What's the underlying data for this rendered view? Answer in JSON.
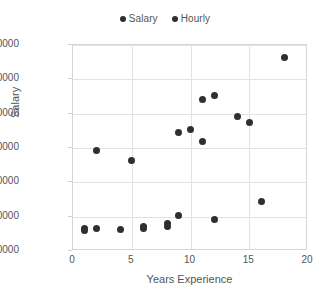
{
  "chart_data": {
    "type": "scatter",
    "title": "",
    "xlabel": "Years Experience",
    "ylabel": "Salary",
    "xlim": [
      0,
      20
    ],
    "ylim": [
      10000,
      70000
    ],
    "xticks": [
      "0",
      "5",
      "10",
      "15",
      "20"
    ],
    "xtick_values": [
      0,
      5,
      10,
      15,
      20
    ],
    "yticks": [
      "10000",
      "20000",
      "30000",
      "40000",
      "50000",
      "60000",
      "70000"
    ],
    "ytick_values": [
      10000,
      20000,
      30000,
      40000,
      50000,
      60000,
      70000
    ],
    "grid": true,
    "legend_position": "top-center",
    "marker_color": "#2f2f2f",
    "series": [
      {
        "name": "Salary",
        "color": "#2f2f2f",
        "points": [
          {
            "x": 2,
            "y": 39200
          },
          {
            "x": 5,
            "y": 36300
          },
          {
            "x": 9,
            "y": 44400
          },
          {
            "x": 10,
            "y": 45300
          },
          {
            "x": 11,
            "y": 54000
          },
          {
            "x": 11,
            "y": 41800
          },
          {
            "x": 12,
            "y": 55200
          },
          {
            "x": 14,
            "y": 49300
          },
          {
            "x": 15,
            "y": 47300
          },
          {
            "x": 16,
            "y": 24300
          },
          {
            "x": 18,
            "y": 66500
          }
        ]
      },
      {
        "name": "Hourly",
        "color": "#2f2f2f",
        "points": [
          {
            "x": 1,
            "y": 16600
          },
          {
            "x": 1,
            "y": 15900
          },
          {
            "x": 2,
            "y": 16600
          },
          {
            "x": 4,
            "y": 16300
          },
          {
            "x": 6,
            "y": 17000
          },
          {
            "x": 6,
            "y": 16500
          },
          {
            "x": 8,
            "y": 17900
          },
          {
            "x": 8,
            "y": 17100
          },
          {
            "x": 9,
            "y": 20400
          },
          {
            "x": 12,
            "y": 19200
          }
        ]
      }
    ]
  },
  "legend": {
    "entries": [
      {
        "label": "Salary",
        "color": "#2f2f2f"
      },
      {
        "label": "Hourly",
        "color": "#2f2f2f"
      }
    ]
  },
  "footer": {
    "text": ""
  }
}
